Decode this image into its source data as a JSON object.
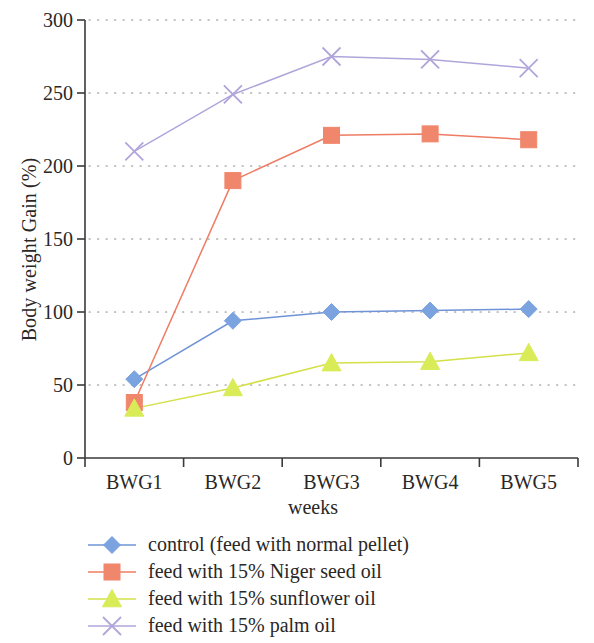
{
  "chart_data": {
    "type": "line",
    "title": "",
    "xlabel": "weeks",
    "ylabel": "Body weight Gain (%)",
    "categories": [
      "BWG1",
      "BWG2",
      "BWG3",
      "BWG4",
      "BWG5"
    ],
    "ylim": [
      0,
      300
    ],
    "yticks": [
      0,
      50,
      100,
      150,
      200,
      250,
      300
    ],
    "ytick_labels": [
      "0",
      "50",
      "100",
      "150",
      "200",
      "250",
      "300"
    ],
    "grid": "horizontal-dotted",
    "legend_position": "bottom-left",
    "series": [
      {
        "name": "control (feed with normal pellet)",
        "values": [
          54,
          94,
          100,
          101,
          102
        ],
        "color": "#6f93d6",
        "marker": "diamond",
        "marker_fill": "#7ba3e0"
      },
      {
        "name": "feed with 15% Niger seed oil",
        "values": [
          38,
          190,
          221,
          222,
          218
        ],
        "color": "#ef7b63",
        "marker": "square",
        "marker_fill": "#f0866b"
      },
      {
        "name": "feed with 15% sunflower oil",
        "values": [
          34,
          48,
          65,
          66,
          72
        ],
        "color": "#d3e048",
        "marker": "triangle",
        "marker_fill": "#d9ec58"
      },
      {
        "name": "feed with 15% palm oil",
        "values": [
          210,
          249,
          275,
          273,
          267
        ],
        "color": "#b0a5da",
        "marker": "cross-x",
        "marker_fill": "#b0a5da"
      }
    ]
  },
  "axes": {
    "y_title": "Body weight Gain (%)",
    "x_title": "weeks",
    "y_labels": [
      "300",
      "250",
      "200",
      "150",
      "100",
      "50",
      "0"
    ],
    "x_labels": [
      "BWG1",
      "BWG2",
      "BWG3",
      "BWG4",
      "BWG5"
    ]
  },
  "legend": {
    "items": [
      {
        "label": "control (feed with normal pellet)",
        "marker": "diamond-marker",
        "color": "#7ba3e0"
      },
      {
        "label": "feed with 15% Niger seed oil",
        "marker": "square-marker",
        "color": "#f0866b"
      },
      {
        "label": "feed with 15% sunflower oil",
        "marker": "triangle-marker",
        "color": "#d9ec58"
      },
      {
        "label": "feed with 15% palm oil",
        "marker": "cross-x-marker",
        "color": "#b0a5da"
      }
    ]
  }
}
